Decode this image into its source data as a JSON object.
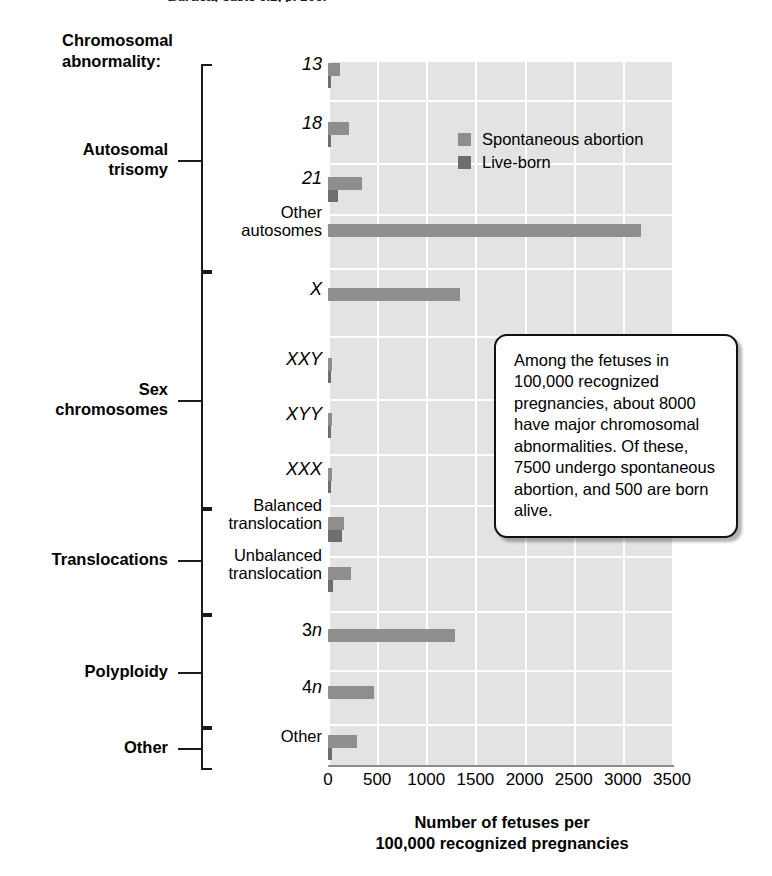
{
  "citation": "Bartlett, Table 8.2, p. 208.",
  "header_label": "Chromosomal\nabnormality:",
  "legend": {
    "items": [
      {
        "label": "Spontaneous abortion",
        "color": "#8e8e8e",
        "key": "spontaneous_abortion"
      },
      {
        "label": "Live-born",
        "color": "#6e6e6e",
        "key": "live_born"
      }
    ]
  },
  "callout": {
    "text": "Among the fetuses in 100,000 recognized pregnancies, about 8000 have major chromosomal abnormalities. Of these, 7500 undergo spontaneous abortion, and 500 are born alive."
  },
  "groups": [
    {
      "label": "Autosomal\ntrisomy",
      "categories": 4
    },
    {
      "label": "Sex\nchromosomes",
      "categories": 4
    },
    {
      "label": "Translocations",
      "categories": 2
    },
    {
      "label": "Polyploidy",
      "categories": 2
    },
    {
      "label": "Other",
      "categories": 1
    }
  ],
  "axis": {
    "ticks": [
      "0",
      "500",
      "1000",
      "1500",
      "2000",
      "2500",
      "3000",
      "3500"
    ],
    "title_line1": "Number of fetuses per",
    "title_line2": "100,000 recognized pregnancies",
    "xmin": 0,
    "xmax": 3500
  },
  "chart_data": {
    "type": "bar",
    "orientation": "horizontal",
    "title": "",
    "xlabel": "Number of fetuses per 100,000 recognized pregnancies",
    "ylabel": "Chromosomal abnormality:",
    "xlim": [
      0,
      3500
    ],
    "grid": true,
    "legend_position": "top-right-inside",
    "categories": [
      "13",
      "18",
      "21",
      "Other autosomes",
      "X",
      "XXY",
      "XYY",
      "XXX",
      "Balanced translocation",
      "Unbalanced translocation",
      "3n",
      "4n",
      "Other"
    ],
    "category_italic": [
      true,
      true,
      true,
      false,
      true,
      true,
      true,
      true,
      false,
      false,
      true,
      true,
      false
    ],
    "category_groups": [
      "Autosomal trisomy",
      "Autosomal trisomy",
      "Autosomal trisomy",
      "Autosomal trisomy",
      "Sex chromosomes",
      "Sex chromosomes",
      "Sex chromosomes",
      "Sex chromosomes",
      "Translocations",
      "Translocations",
      "Polyploidy",
      "Polyploidy",
      "Other"
    ],
    "series": [
      {
        "name": "Spontaneous abortion",
        "color": "#8e8e8e",
        "values": [
          120,
          210,
          350,
          3180,
          1340,
          40,
          45,
          40,
          160,
          230,
          1290,
          470,
          290
        ]
      },
      {
        "name": "Live-born",
        "color": "#6e6e6e",
        "values": [
          5,
          10,
          105,
          0,
          0,
          35,
          35,
          30,
          140,
          50,
          0,
          0,
          40
        ]
      }
    ]
  }
}
